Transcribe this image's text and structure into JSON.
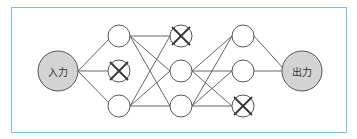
{
  "diagram": {
    "input_label": "入力",
    "output_label": "出力",
    "colors": {
      "frame_border": "#7ec3e6",
      "io_fill": "#d3d3d3",
      "edge": "#555555"
    },
    "layers": [
      {
        "name": "input",
        "nodes": [
          {
            "id": "in",
            "label": "入力",
            "dropped": false
          }
        ]
      },
      {
        "name": "hidden1",
        "nodes": [
          {
            "id": "h1a",
            "dropped": false
          },
          {
            "id": "h1b",
            "dropped": true
          },
          {
            "id": "h1c",
            "dropped": false
          }
        ]
      },
      {
        "name": "hidden2",
        "nodes": [
          {
            "id": "h2a",
            "dropped": true
          },
          {
            "id": "h2b",
            "dropped": false
          },
          {
            "id": "h2c",
            "dropped": false
          }
        ]
      },
      {
        "name": "hidden3",
        "nodes": [
          {
            "id": "h3a",
            "dropped": false
          },
          {
            "id": "h3b",
            "dropped": false
          },
          {
            "id": "h3c",
            "dropped": true
          }
        ]
      },
      {
        "name": "output",
        "nodes": [
          {
            "id": "out",
            "label": "出力",
            "dropped": false
          }
        ]
      }
    ],
    "edges": [
      [
        "in",
        "h1a"
      ],
      [
        "in",
        "h1b"
      ],
      [
        "in",
        "h1c"
      ],
      [
        "h1a",
        "h2a"
      ],
      [
        "h1a",
        "h2b"
      ],
      [
        "h1a",
        "h2c"
      ],
      [
        "h1c",
        "h2a"
      ],
      [
        "h1c",
        "h2b"
      ],
      [
        "h1c",
        "h2c"
      ],
      [
        "h2b",
        "h3a"
      ],
      [
        "h2b",
        "h3b"
      ],
      [
        "h2b",
        "h3c"
      ],
      [
        "h2c",
        "h3a"
      ],
      [
        "h2c",
        "h3b"
      ],
      [
        "h2c",
        "h3c"
      ],
      [
        "h3a",
        "out"
      ],
      [
        "h3b",
        "out"
      ]
    ]
  }
}
